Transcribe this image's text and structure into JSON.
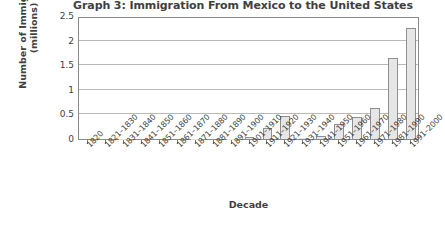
{
  "chart_data": {
    "type": "bar",
    "title": "Graph 3: Immigration From Mexico to the United States",
    "xlabel": "Decade",
    "ylabel": "Number of Immigrants\n(millions)",
    "ylim": [
      0,
      2.5
    ],
    "yticks": [
      "0",
      "0.5",
      "1",
      "1.5",
      "2",
      "2.5"
    ],
    "ytick_values": [
      0,
      0.5,
      1,
      1.5,
      2,
      2.5
    ],
    "grid": true,
    "legend": "none",
    "bar_color": "#e6e6e6",
    "bar_edge_color": "#8f8f8f",
    "categories": [
      "1820",
      "1821–1830",
      "1831–1840",
      "1841–1850",
      "1851–1860",
      "1861–1870",
      "1871–1880",
      "1881–1890",
      "1891–1900",
      "1901–1910",
      "1911–1920",
      "1921–1930",
      "1931–1940",
      "1941–1950",
      "1951–1960",
      "1961–1970",
      "1971–1980",
      "1981–1990",
      "1991–2000"
    ],
    "values": [
      0.0,
      0.0,
      0.01,
      0.0,
      0.0,
      0.0,
      0.01,
      0.0,
      0.01,
      0.05,
      0.22,
      0.46,
      0.02,
      0.06,
      0.3,
      0.45,
      0.64,
      1.65,
      2.25
    ]
  }
}
